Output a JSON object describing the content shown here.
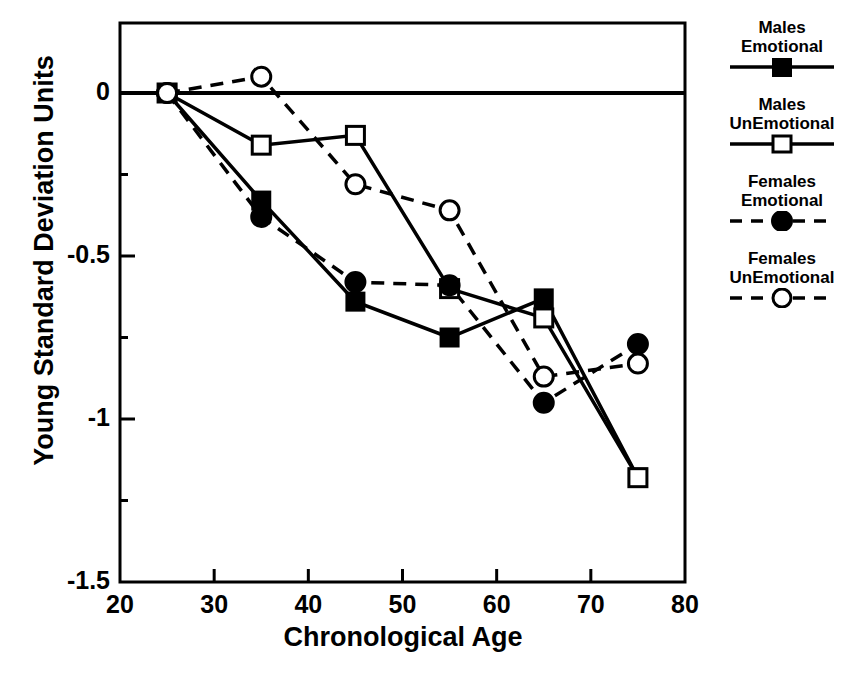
{
  "chart_data": {
    "type": "line",
    "title": "",
    "xlabel": "Chronological Age",
    "ylabel": "Young Standard Deviation Units",
    "xlim": [
      20,
      80
    ],
    "ylim": [
      -1.5,
      0.15
    ],
    "xticks": [
      20,
      30,
      40,
      50,
      60,
      70,
      80
    ],
    "yticks": [
      0,
      -0.5,
      -1,
      -1.5
    ],
    "ytick_labels": [
      "0",
      "-0.5",
      "-1",
      "-1.5"
    ],
    "xtick_labels": [
      "20",
      "30",
      "40",
      "50",
      "60",
      "70",
      "80"
    ],
    "grid": false,
    "legend_position": "right",
    "x": [
      25,
      35,
      45,
      55,
      65,
      75
    ],
    "series": [
      {
        "name": "Males Emotional",
        "name_line1": "Males",
        "name_line2": "Emotional",
        "marker": "filled-square",
        "linestyle": "solid",
        "color": "#000000",
        "values": [
          0.0,
          -0.33,
          -0.64,
          -0.75,
          -0.63,
          -1.18
        ]
      },
      {
        "name": "Males UnEmotional",
        "name_line1": "Males",
        "name_line2": "UnEmotional",
        "marker": "open-square",
        "linestyle": "solid",
        "color": "#000000",
        "values": [
          0.0,
          -0.16,
          -0.13,
          -0.6,
          -0.69,
          -1.18
        ]
      },
      {
        "name": "Females Emotional",
        "name_line1": "Females",
        "name_line2": "Emotional",
        "marker": "filled-circle",
        "linestyle": "dashed",
        "color": "#000000",
        "values": [
          0.0,
          -0.38,
          -0.58,
          -0.59,
          -0.95,
          -0.77
        ]
      },
      {
        "name": "Females UnEmotional",
        "name_line1": "Females",
        "name_line2": "UnEmotional",
        "marker": "open-circle",
        "linestyle": "dashed",
        "color": "#000000",
        "values": [
          0.0,
          0.05,
          -0.28,
          -0.36,
          -0.87,
          -0.83
        ]
      }
    ]
  }
}
